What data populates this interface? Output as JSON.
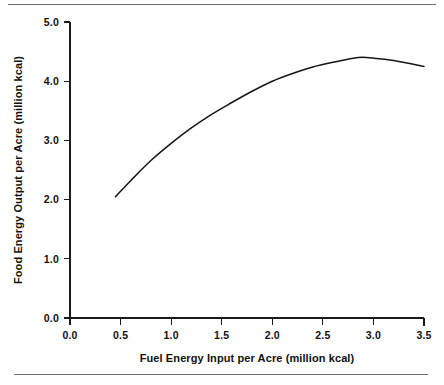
{
  "chart_data": {
    "type": "line",
    "title": "",
    "subtitle": "",
    "xlabel": "Fuel Energy Input per Acre (million kcal)",
    "ylabel": "Food Energy Output per Acre (million kcal)",
    "xlim": [
      0.0,
      3.5
    ],
    "ylim": [
      0.0,
      5.0
    ],
    "xticks": [
      0.0,
      0.5,
      1.0,
      1.5,
      2.0,
      2.5,
      3.0,
      3.5
    ],
    "yticks": [
      0.0,
      1.0,
      2.0,
      3.0,
      4.0,
      5.0
    ],
    "xtick_labels": [
      "0.0",
      "0.5",
      "1.0",
      "1.5",
      "2.0",
      "2.5",
      "3.0",
      "3.5"
    ],
    "ytick_labels": [
      "0.0",
      "1.0",
      "2.0",
      "3.0",
      "4.0",
      "5.0"
    ],
    "grid": false,
    "legend": null,
    "legend_position": "none",
    "annotations": [],
    "series": [
      {
        "name": "Food energy output response",
        "color": "#161616",
        "x": [
          0.45,
          0.6,
          0.8,
          1.0,
          1.2,
          1.4,
          1.6,
          1.8,
          2.0,
          2.2,
          2.4,
          2.6,
          2.85,
          3.0,
          3.2,
          3.5
        ],
        "values": [
          2.05,
          2.32,
          2.66,
          2.95,
          3.21,
          3.44,
          3.64,
          3.83,
          4.0,
          4.13,
          4.24,
          4.32,
          4.4,
          4.39,
          4.35,
          4.25
        ]
      }
    ]
  }
}
